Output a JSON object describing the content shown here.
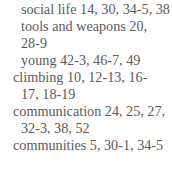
{
  "index": {
    "lines": [
      {
        "text": "social life 14, 30, 34-5, 38",
        "indent": 21,
        "top": 1
      },
      {
        "text": "tools and weapons 20,",
        "indent": 21,
        "top": 18
      },
      {
        "text": "28-9",
        "indent": 21,
        "top": 35
      },
      {
        "text": "young 42-3, 46-7, 49",
        "indent": 21,
        "top": 52
      },
      {
        "text": "climbing 10, 12-13, 16-",
        "indent": 13,
        "top": 69
      },
      {
        "text": "17, 18-19",
        "indent": 21,
        "top": 86
      },
      {
        "text": "communication 24, 25, 27,",
        "indent": 13,
        "top": 103
      },
      {
        "text": "32-3, 38, 52",
        "indent": 21,
        "top": 120
      },
      {
        "text": "communities 5, 30-1, 34-5",
        "indent": 13,
        "top": 137
      }
    ]
  }
}
